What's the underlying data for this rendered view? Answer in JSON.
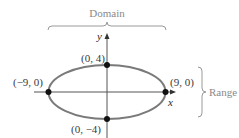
{
  "figure": {
    "type": "ellipse-domain-range",
    "ellipse": {
      "center": [
        0,
        0
      ],
      "semi_major_x": 9,
      "semi_minor_y": 4
    },
    "axes": {
      "x_label": "x",
      "y_label": "y"
    },
    "points": [
      {
        "label": "(0, 4)",
        "x": 0,
        "y": 4
      },
      {
        "label": "(0, −4)",
        "x": 0,
        "y": -4
      },
      {
        "label": "(−9, 0)",
        "x": -9,
        "y": 0
      },
      {
        "label": "(9, 0)",
        "x": 9,
        "y": 0
      }
    ],
    "braces": {
      "domain_label": "Domain",
      "range_label": "Range"
    },
    "colors": {
      "ellipse": "#7a7a7a",
      "axes": "#555555",
      "points": "#111111",
      "brace": "#9a9a9a"
    }
  }
}
